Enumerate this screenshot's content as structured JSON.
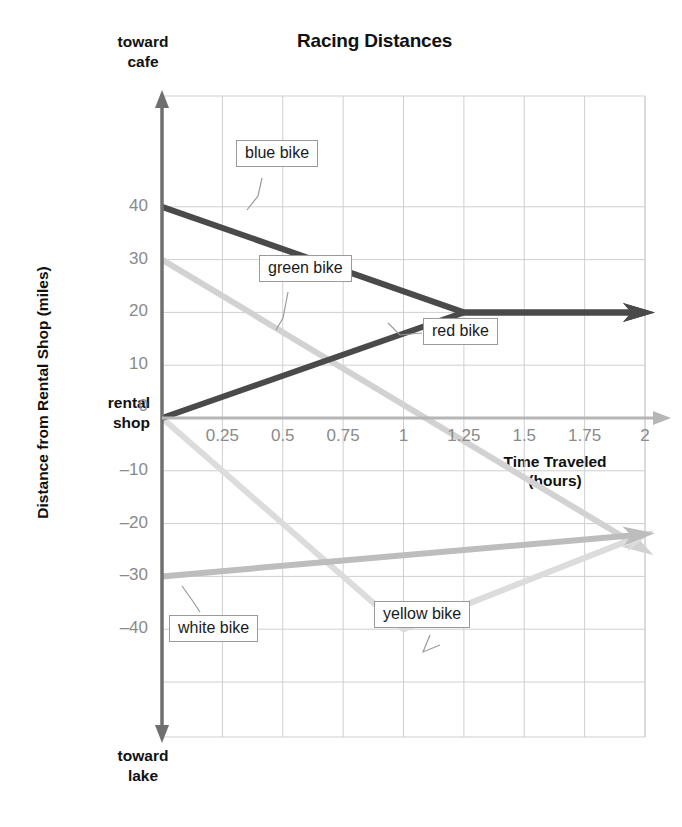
{
  "chart_data": {
    "type": "line",
    "title": "Racing Distances",
    "xlabel": "Time Traveled (hours)",
    "xlabel_line1": "Time Traveled",
    "xlabel_line2": "(hours)",
    "ylabel": "Distance from Rental Shop (miles)",
    "xlim": [
      0,
      2
    ],
    "ylim": [
      -50,
      50
    ],
    "grid": true,
    "legend": "inline callout labels",
    "xticks": [
      "0.25",
      "0.5",
      "0.75",
      "1",
      "1.25",
      "1.5",
      "1.75",
      "2"
    ],
    "xtick_values": [
      0.25,
      0.5,
      0.75,
      1,
      1.25,
      1.5,
      1.75,
      2
    ],
    "yticks": [
      "40",
      "30",
      "20",
      "10",
      "0",
      "–10",
      "–20",
      "–30",
      "–40"
    ],
    "ytick_values": [
      40,
      30,
      20,
      10,
      0,
      -10,
      -20,
      -30,
      -40
    ],
    "axis_endpoint_labels": {
      "y_top_line1": "toward",
      "y_top_line2": "cafe",
      "y_bottom_line1": "toward",
      "y_bottom_line2": "lake",
      "y_origin_line1": "rental",
      "y_origin_line2": "shop"
    },
    "series": [
      {
        "name": "blue bike",
        "color": "#4a4a4a",
        "width": 6,
        "arrow": true,
        "points": [
          [
            0,
            40
          ],
          [
            1.25,
            20
          ],
          [
            2,
            20
          ]
        ]
      },
      {
        "name": "red bike",
        "color": "#4a4a4a",
        "width": 6,
        "arrow": true,
        "points": [
          [
            0,
            0
          ],
          [
            1.25,
            20
          ],
          [
            2,
            20
          ]
        ]
      },
      {
        "name": "green bike",
        "color": "#d2d2d2",
        "width": 6,
        "arrow": true,
        "points": [
          [
            0,
            30
          ],
          [
            2,
            -25
          ]
        ]
      },
      {
        "name": "white bike",
        "color": "#bdbdbd",
        "width": 6,
        "arrow": true,
        "points": [
          [
            0,
            -30
          ],
          [
            2,
            -22
          ]
        ]
      },
      {
        "name": "yellow bike",
        "color": "#dcdcdc",
        "width": 6,
        "arrow": true,
        "points": [
          [
            0,
            0
          ],
          [
            1,
            -40
          ],
          [
            2,
            -22
          ]
        ]
      }
    ],
    "callouts": [
      {
        "label": "blue bike",
        "x": 236,
        "y": 140
      },
      {
        "label": "green bike",
        "x": 259,
        "y": 255
      },
      {
        "label": "red bike",
        "x": 423,
        "y": 318
      },
      {
        "label": "yellow bike",
        "x": 374,
        "y": 601
      },
      {
        "label": "white bike",
        "x": 169,
        "y": 615
      }
    ]
  }
}
